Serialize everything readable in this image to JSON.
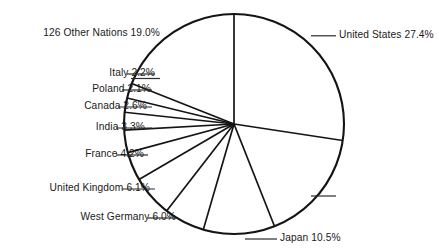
{
  "chart_data": {
    "type": "pie",
    "title": "",
    "subtitle": "",
    "xlabel": "",
    "ylabel": "",
    "legend_position": "none",
    "grid": false,
    "units": "percent",
    "start_angle_deg": 0,
    "direction": "clockwise",
    "categories": [
      "United States",
      "U.S.S.R.",
      "Japan",
      "West Germany",
      "United Kingdom",
      "France",
      "India",
      "Canada",
      "Poland",
      "Italy",
      "126 Other Nations"
    ],
    "values": [
      27.4,
      16.6,
      10.5,
      6.0,
      6.1,
      4.2,
      3.3,
      2.6,
      2.1,
      2.2,
      19.0
    ],
    "slices": [
      {
        "name": "United States",
        "value": 27.4,
        "label": "United States 27.4%"
      },
      {
        "name": "U.S.S.R.",
        "value": 16.6,
        "label": "U.S.S.R. 16.6%"
      },
      {
        "name": "Japan",
        "value": 10.5,
        "label": "Japan 10.5%"
      },
      {
        "name": "West Germany",
        "value": 6.0,
        "label": "West Germany 6.0%"
      },
      {
        "name": "United Kingdom",
        "value": 6.1,
        "label": "United Kingdom 6.1%"
      },
      {
        "name": "France",
        "value": 4.2,
        "label": "France 4.2%"
      },
      {
        "name": "India",
        "value": 3.3,
        "label": "India 3.3%"
      },
      {
        "name": "Canada",
        "value": 2.6,
        "label": "Canada 2.6%"
      },
      {
        "name": "Poland",
        "value": 2.1,
        "label": "Poland 2.1%"
      },
      {
        "name": "Italy",
        "value": 2.2,
        "label": "Italy 2.2%"
      },
      {
        "name": "126 Other Nations",
        "value": 19.0,
        "label": "126 Other Nations 19.0%"
      }
    ]
  },
  "labels": {
    "united_states": "United States 27.4%",
    "ussr": "U.S.S.R. 16.6%",
    "japan": "Japan 10.5%",
    "west_germany": "West Germany 6.0%",
    "united_kingdom": "United Kingdom 6.1%",
    "france": "France 4.2%",
    "india": "India 3.3%",
    "canada": "Canada 2.6%",
    "poland": "Poland 2.1%",
    "italy": "Italy 2.2%",
    "other_nations": "126 Other Nations 19.0%"
  },
  "colors": {
    "background": "#ffffff",
    "outline": "#141414",
    "divider": "#141414",
    "leader": "#2a2a2a",
    "text": "#1a1a1a",
    "slice_fill": "#ffffff"
  }
}
